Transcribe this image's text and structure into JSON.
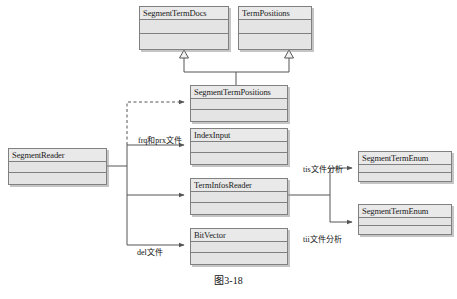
{
  "diagram": {
    "caption": "图3-18",
    "classes": {
      "segment_term_docs": {
        "name": "SegmentTermDocs"
      },
      "term_positions": {
        "name": "TermPositions"
      },
      "segment_term_positions": {
        "name": "SegmentTermPositions"
      },
      "segment_reader": {
        "name": "SegmentReader"
      },
      "index_input": {
        "name": "IndexInput"
      },
      "term_infos_reader": {
        "name": "TermInfosReader"
      },
      "bit_vector": {
        "name": "BitVector"
      },
      "segment_term_enum_top": {
        "name": "SegmentTermEnum"
      },
      "segment_term_enum_bottom": {
        "name": "SegmentTermEnum"
      }
    },
    "edge_labels": {
      "frq_prx": "frq和prx文件",
      "del": "del文件",
      "tis": "tis文件分析",
      "tii": "tii文件分析"
    },
    "colors": {
      "box_fill": "#e6e6e6",
      "box_border": "#808080",
      "line": "#555555",
      "text": "#1a1a1a"
    }
  }
}
